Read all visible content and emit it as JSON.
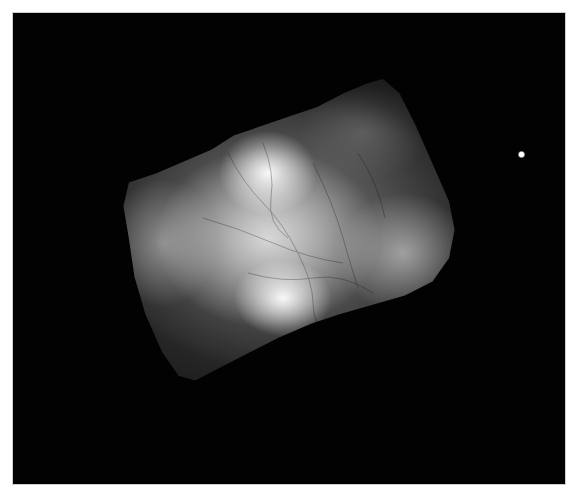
{
  "image": {
    "description": "Monochrome astronomical image of a bright, tilted rectangular-shaped nebula with filamentary texture against a black sky, single bright star to the right",
    "frame_color": "#020202",
    "background_color": "#ffffff",
    "nebula_color": "#e8e8e8",
    "star_color": "#ffffff"
  },
  "objects": {
    "nebula": {
      "label": "nebula",
      "center": [
        280,
        230
      ]
    },
    "star": {
      "label": "star",
      "position": [
        521,
        154
      ]
    }
  }
}
